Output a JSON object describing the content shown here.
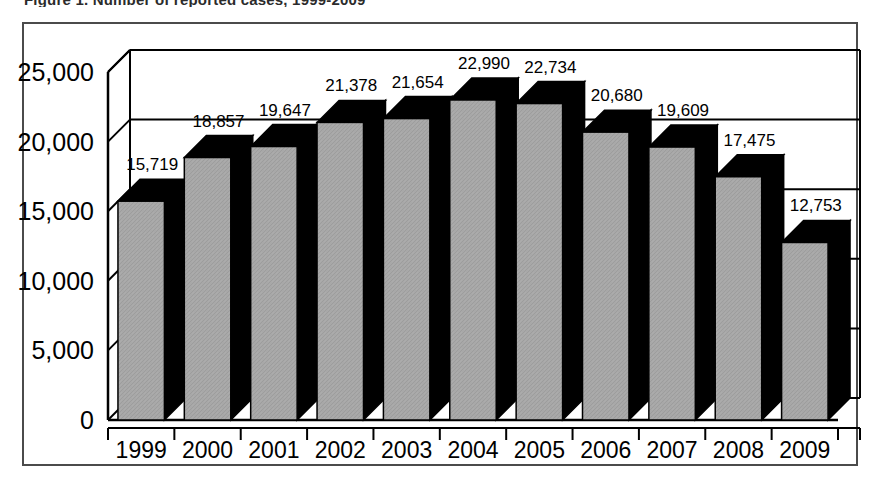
{
  "caption": {
    "text": "Figure 1.  Number of reported cases, 1999-2009"
  },
  "frame": {
    "border_color": "#4b4b4b"
  },
  "colors": {
    "bar_front": "#a8a8a8",
    "bar_top": "#000000",
    "bar_side": "#000000",
    "axis": "#000000",
    "gridline": "#000000",
    "background": "#ffffff"
  },
  "chart_data": {
    "type": "bar",
    "title": "",
    "subtitle": "",
    "xlabel": "",
    "ylabel": "",
    "categories": [
      "1999",
      "2000",
      "2001",
      "2002",
      "2003",
      "2004",
      "2005",
      "2006",
      "2007",
      "2008",
      "2009"
    ],
    "values": [
      15719,
      18857,
      19647,
      21378,
      21654,
      22990,
      22734,
      20680,
      19609,
      17475,
      12753
    ],
    "data_labels": [
      "15,719",
      "18,857",
      "19,647",
      "21,378",
      "21,654",
      "22,990",
      "22,734",
      "20,680",
      "19,609",
      "17,475",
      "12,753"
    ],
    "ylim": [
      0,
      25000
    ],
    "yticks": [
      0,
      5000,
      10000,
      15000,
      20000,
      25000
    ],
    "ytick_labels": [
      "0",
      "5,000",
      "10,000",
      "15,000",
      "20,000",
      "25,000"
    ],
    "grid": true,
    "grid_axis": "y",
    "legend": null,
    "legend_position": "none",
    "style": "3d-column",
    "series": [
      {
        "name": "Cases",
        "values": [
          15719,
          18857,
          19647,
          21378,
          21654,
          22990,
          22734,
          20680,
          19609,
          17475,
          12753
        ]
      }
    ]
  }
}
